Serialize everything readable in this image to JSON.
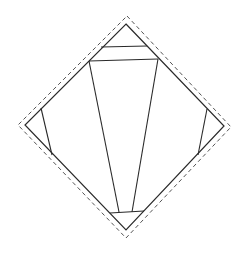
{
  "diagram": {
    "colors": {
      "stroke": "#2a2a2a",
      "dashed": "#555555",
      "background": "#ffffff"
    },
    "outer_dashed": [
      [
        127,
        16
      ],
      [
        231,
        127
      ],
      [
        126,
        238
      ],
      [
        18,
        125
      ]
    ],
    "diamond": [
      [
        126,
        24
      ],
      [
        224,
        126
      ],
      [
        126,
        230
      ],
      [
        25,
        125
      ]
    ],
    "lines": [
      {
        "name": "top-band-upper",
        "points": [
          [
            101,
            47
          ],
          [
            147,
            46
          ]
        ]
      },
      {
        "name": "top-band-lower",
        "points": [
          [
            89,
            61
          ],
          [
            158,
            59
          ]
        ]
      },
      {
        "name": "center-wedge-left",
        "points": [
          [
            89,
            61
          ],
          [
            119,
            212
          ]
        ]
      },
      {
        "name": "center-wedge-right",
        "points": [
          [
            158,
            59
          ],
          [
            132,
            212
          ]
        ]
      },
      {
        "name": "bottom-band",
        "points": [
          [
            110,
            213
          ],
          [
            144,
            211
          ]
        ]
      },
      {
        "name": "left-wedge",
        "points": [
          [
            41,
            108
          ],
          [
            52,
            155
          ]
        ]
      },
      {
        "name": "right-wedge",
        "points": [
          [
            207,
            109
          ],
          [
            198,
            155
          ]
        ]
      }
    ]
  }
}
